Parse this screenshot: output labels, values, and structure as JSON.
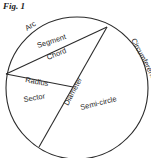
{
  "figure": {
    "title": "Fig. 1",
    "labels": {
      "arc": "Arc",
      "segment": "Segment",
      "chord": "Chord",
      "radius": "Radius",
      "sector": "Sector",
      "diameter": "Diameter",
      "semicircle": "Semi-circle",
      "circumference": "Circumference"
    },
    "colors": {
      "line": "#2b2b2b",
      "text": "#2a2a2a",
      "background": "#ffffff"
    }
  }
}
